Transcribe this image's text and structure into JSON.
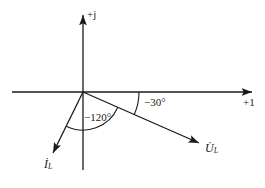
{
  "figure": {
    "kind": "phasor-diagram",
    "background_color": "#ffffff",
    "stroke_color": "#1a1a1a"
  },
  "axes": {
    "imaginary": {
      "label": "+j",
      "icon": "arrow-up-icon",
      "origin": [
        83,
        92
      ],
      "tip": [
        83,
        12
      ]
    },
    "real": {
      "label": "+1",
      "icon": "arrow-right-icon",
      "origin": [
        83,
        92
      ],
      "tip": [
        255,
        92
      ],
      "start": [
        12,
        92
      ]
    }
  },
  "phasors": [
    {
      "id": "voltage",
      "label": "U",
      "subscript": "L",
      "overdot": true,
      "angle_deg": -30,
      "angle_label": "−30°",
      "tip": [
        202,
        145
      ],
      "icon": "arrow-right-down-icon"
    },
    {
      "id": "current",
      "label": "I",
      "subscript": "L",
      "overdot": true,
      "angle_deg": -120,
      "angle_label": "−120°",
      "tip": [
        50,
        158
      ],
      "icon": "arrow-left-down-icon"
    }
  ],
  "angle_arcs": [
    {
      "id": "arc-minus-30",
      "label": "−30°",
      "radius": 56,
      "from_deg": 0,
      "to_deg": -24
    },
    {
      "id": "arc-minus-120",
      "label": "−120°",
      "radius": 38,
      "from_deg": -24,
      "to_deg": -116
    }
  ],
  "labels": {
    "imaginary_axis": "+j",
    "real_axis": "+1",
    "angle_voltage": "−30°",
    "angle_current": "−120°",
    "phasor_voltage_base": "U",
    "phasor_voltage_sub": "L",
    "phasor_current_base": "I",
    "phasor_current_sub": "L"
  }
}
